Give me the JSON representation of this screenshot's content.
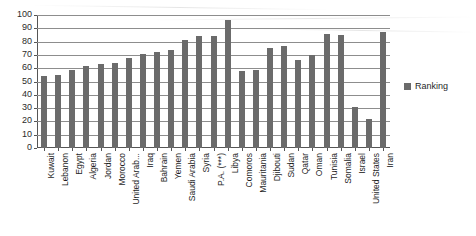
{
  "chart_data": {
    "type": "bar",
    "title": "",
    "xlabel": "",
    "ylabel": "",
    "ylim": [
      0,
      100
    ],
    "ytick_step": 10,
    "yticks": [
      100,
      90,
      80,
      70,
      60,
      50,
      40,
      30,
      20,
      10,
      0
    ],
    "grid": true,
    "legend_position": "right",
    "series_name": "Ranking",
    "bar_color": "#6b6b6b",
    "categories": [
      "Kuwait",
      "Lebanon",
      "Egypt",
      "Algeria",
      "Jordan",
      "Morocco",
      "United Arab...",
      "Iraq",
      "Bahrain",
      "Yemen",
      "Saudi Arabia",
      "Syria",
      "P.A. (***)",
      "Libya",
      "Comoros",
      "Mauritania",
      "Djibouti",
      "Sudan",
      "Qatar",
      "Oman",
      "Tunisia",
      "Somalia",
      "Israel",
      "United States",
      "Iran"
    ],
    "values": [
      54,
      55,
      59,
      62,
      63,
      64,
      68,
      71,
      72,
      74,
      81,
      84,
      84,
      96,
      58,
      59,
      75,
      77,
      66,
      70,
      86,
      85,
      31,
      22,
      87
    ],
    "series": [
      {
        "name": "Ranking",
        "values": [
          54,
          55,
          59,
          62,
          63,
          64,
          68,
          71,
          72,
          74,
          81,
          84,
          84,
          96,
          58,
          59,
          75,
          77,
          66,
          70,
          86,
          85,
          31,
          22,
          87
        ]
      }
    ]
  },
  "legend": {
    "entries": [
      {
        "label": "Ranking",
        "color": "#6b6b6b"
      }
    ]
  }
}
